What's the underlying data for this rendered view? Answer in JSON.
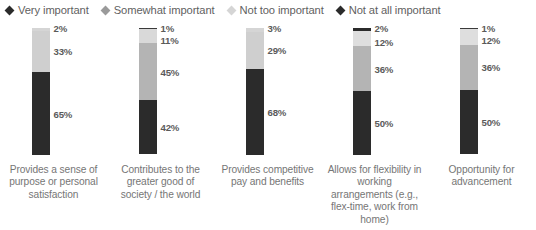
{
  "legend": {
    "items": [
      {
        "label": "Very important",
        "color": "#2b2b2b",
        "marker": "diamond-marker"
      },
      {
        "label": "Somewhat important",
        "color": "#9a9a9a",
        "marker": "diamond-marker"
      },
      {
        "label": "Not too important",
        "color": "#d5d5d5",
        "marker": "diamond-marker"
      },
      {
        "label": "Not at all important",
        "color": "#2b2b2b",
        "marker": "diamond-marker"
      }
    ]
  },
  "chart_data": {
    "type": "bar",
    "subtype": "stacked-100-percent",
    "title": "",
    "xlabel": "",
    "ylabel": "",
    "ylim": [
      0,
      100
    ],
    "grid": false,
    "legend_position": "top-left",
    "orientation": "vertical",
    "value_suffix": "%",
    "categories": [
      "Provides a sense of purpose or personal satisfaction",
      "Contributes to the greater good of society / the world",
      "Provides competitive pay and benefits",
      "Allows for flexibility in working arrangements (e.g., flex-time, work from home)",
      "Opportunity for advancement"
    ],
    "series": [
      {
        "name": "Very important",
        "values": [
          65,
          42,
          68,
          50,
          50
        ]
      },
      {
        "name": "Somewhat important",
        "values": [
          33,
          45,
          29,
          36,
          36
        ]
      },
      {
        "name": "Not too important",
        "values": [
          0,
          11,
          0,
          12,
          12
        ]
      },
      {
        "name": "Not at all important",
        "values": [
          2,
          1,
          3,
          2,
          1
        ]
      }
    ]
  },
  "columns": [
    {
      "label": "Provides a sense of purpose or personal satisfaction",
      "segments": [
        {
          "name": "Not at all important",
          "value": "2%",
          "pct": 2,
          "color": "#d5d5d5",
          "label_pos": "above-0"
        },
        {
          "name": "Somewhat important",
          "value": "33%",
          "pct": 33,
          "color": "#cfcfcf",
          "label_pos": "center"
        },
        {
          "name": "Very important",
          "value": "65%",
          "pct": 65,
          "color": "#2b2b2b",
          "label_pos": "center"
        }
      ]
    },
    {
      "label": "Contributes to the greater good of society / the world",
      "segments": [
        {
          "name": "Not at all important",
          "value": "1%",
          "pct": 1,
          "color": "#3a3a3a",
          "label_pos": "above-0"
        },
        {
          "name": "Not too important",
          "value": "11%",
          "pct": 11,
          "color": "#d9d9d9",
          "label_pos": "above-1"
        },
        {
          "name": "Somewhat important",
          "value": "45%",
          "pct": 45,
          "color": "#b4b4b4",
          "label_pos": "center"
        },
        {
          "name": "Very important",
          "value": "42%",
          "pct": 42,
          "color": "#2b2b2b",
          "label_pos": "center"
        }
      ]
    },
    {
      "label": "Provides competitive pay and benefits",
      "segments": [
        {
          "name": "Not at all important",
          "value": "3%",
          "pct": 3,
          "color": "#d5d5d5",
          "label_pos": "above-0"
        },
        {
          "name": "Somewhat important",
          "value": "29%",
          "pct": 29,
          "color": "#cfcfcf",
          "label_pos": "center"
        },
        {
          "name": "Very important",
          "value": "68%",
          "pct": 68,
          "color": "#2b2b2b",
          "label_pos": "center"
        }
      ]
    },
    {
      "label": "Allows for flexibility in working arrangements (e.g., flex-time, work from home)",
      "segments": [
        {
          "name": "Not at all important",
          "value": "2%",
          "pct": 2,
          "color": "#2b2b2b",
          "label_pos": "above-0"
        },
        {
          "name": "Not too important",
          "value": "12%",
          "pct": 12,
          "color": "#dedede",
          "label_pos": "above-1"
        },
        {
          "name": "Somewhat important",
          "value": "36%",
          "pct": 36,
          "color": "#b4b4b4",
          "label_pos": "center"
        },
        {
          "name": "Very important",
          "value": "50%",
          "pct": 50,
          "color": "#2b2b2b",
          "label_pos": "center"
        }
      ]
    },
    {
      "label": "Opportunity for advancement",
      "segments": [
        {
          "name": "Not at all important",
          "value": "1%",
          "pct": 1,
          "color": "#3a3a3a",
          "label_pos": "above-0"
        },
        {
          "name": "Not too important",
          "value": "12%",
          "pct": 12,
          "color": "#dedede",
          "label_pos": "above-1"
        },
        {
          "name": "Somewhat important",
          "value": "36%",
          "pct": 36,
          "color": "#b4b4b4",
          "label_pos": "center"
        },
        {
          "name": "Very important",
          "value": "50%",
          "pct": 50,
          "color": "#2b2b2b",
          "label_pos": "center"
        }
      ]
    }
  ]
}
